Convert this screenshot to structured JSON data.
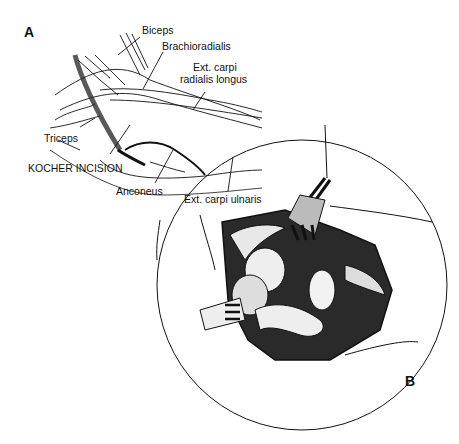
{
  "figure": {
    "panels": [
      {
        "id": "A",
        "label": "A"
      },
      {
        "id": "B",
        "label": "B"
      }
    ],
    "panel_a_labels": {
      "biceps": "Biceps",
      "brachioradialis": "Brachioradialis",
      "ecrl_line1": "Ext. carpi",
      "ecrl_line2": "radialis longus",
      "triceps": "Triceps",
      "kocher": "KOCHER INCISION",
      "anconeus": "Anconeus",
      "ecu": "Ext. carpi ulnaris"
    },
    "colors": {
      "ink": "#111111",
      "background": "#ffffff"
    }
  }
}
